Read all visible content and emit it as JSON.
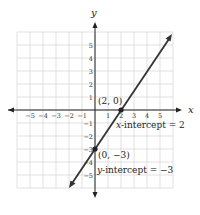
{
  "chart_data": {
    "type": "line",
    "title": "",
    "xlabel": "x",
    "ylabel": "y",
    "xlim": [
      -6,
      6
    ],
    "ylim": [
      -6,
      6
    ],
    "grid": true,
    "x_ticks": [
      "−5",
      "−4",
      "−3",
      "−2",
      "−1",
      "1",
      "2",
      "3",
      "4",
      "5"
    ],
    "y_ticks": [
      "5",
      "4",
      "3",
      "2",
      "1",
      "−1",
      "−2",
      "−3",
      "−4",
      "−5"
    ],
    "series": [
      {
        "name": "y = 1.5x − 3",
        "x": [
          -1.8,
          4
        ],
        "y": [
          -5.7,
          3
        ],
        "arrows": "both"
      }
    ],
    "points": [
      {
        "x": 2,
        "y": 0,
        "label": "(2, 0)"
      },
      {
        "x": 0,
        "y": -3,
        "label": "(0, −3)"
      }
    ],
    "annotations": [
      {
        "text_var": "x",
        "text": "-intercept = 2"
      },
      {
        "text_var": "y",
        "text": "-intercept = −3"
      }
    ]
  },
  "labels": {
    "x_axis": "x",
    "y_axis": "y",
    "point_a": "(2, 0)",
    "point_b": "(0, −3)",
    "x_int_var": "x",
    "x_int_text": "-intercept = 2",
    "y_int_var": "y",
    "y_int_text": "-intercept = −3",
    "xt": [
      "−5",
      "−4",
      "−3",
      "−2",
      "−1",
      "1",
      "2",
      "3",
      "4",
      "5"
    ],
    "yt": [
      "5",
      "4",
      "3",
      "2",
      "1",
      "−1",
      "−2",
      "−3",
      "−4",
      "−5"
    ]
  }
}
